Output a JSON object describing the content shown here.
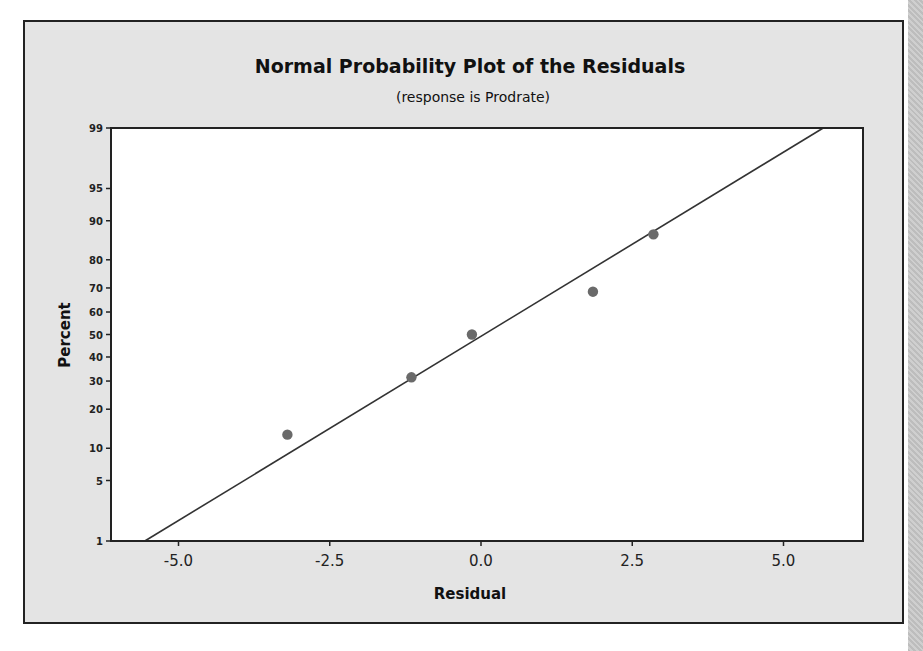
{
  "chart_data": {
    "type": "scatter",
    "title": "Normal Probability Plot of the Residuals",
    "subtitle": "(response is Prodrate)",
    "xlabel": "Residual",
    "ylabel": "Percent",
    "xlim": [
      -6.05,
      6.3
    ],
    "ylim": [
      1,
      99
    ],
    "y_scale": "normal-probability",
    "x_ticks": [
      -5.0,
      -2.5,
      0.0,
      2.5,
      5.0
    ],
    "x_tick_labels": [
      "-5.0",
      "-2.5",
      "0.0",
      "2.5",
      "5.0"
    ],
    "y_ticks": [
      1,
      5,
      10,
      20,
      30,
      40,
      50,
      60,
      70,
      80,
      90,
      95,
      99
    ],
    "y_tick_labels": [
      "1",
      "5",
      "10",
      "20",
      "30",
      "40",
      "50",
      "60",
      "70",
      "80",
      "90",
      "95",
      "99"
    ],
    "grid": false,
    "legend": null,
    "series": [
      {
        "name": "Residuals",
        "x": [
          -3.2,
          -1.15,
          -0.15,
          1.85,
          2.85
        ],
        "y": [
          12.96,
          31.48,
          50.0,
          68.52,
          87.04
        ]
      }
    ],
    "fit_line": {
      "mean": 0.05,
      "stdev": 2.41
    },
    "colors": {
      "points": "#6a6a6a",
      "line": "#333333",
      "plot_bg": "#ffffff",
      "frame_bg": "#e4e4e4"
    }
  }
}
